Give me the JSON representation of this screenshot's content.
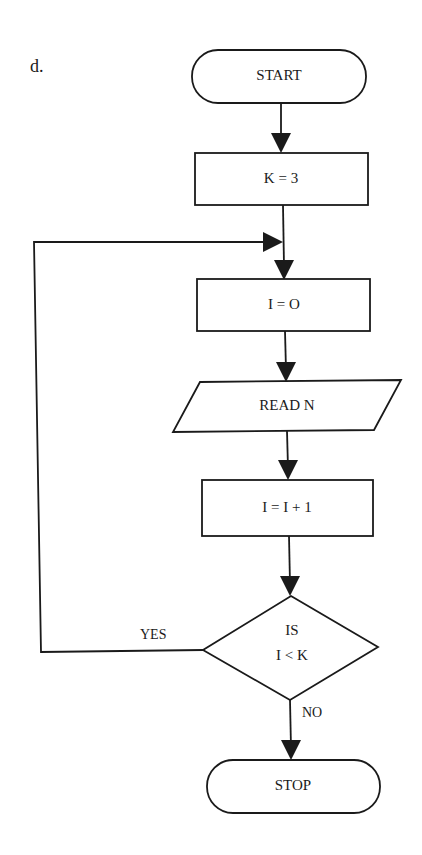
{
  "diagram": {
    "part_label": "d.",
    "nodes": {
      "start": {
        "type": "terminal",
        "label": "START"
      },
      "k_init": {
        "type": "process",
        "label": "K = 3"
      },
      "i_init": {
        "type": "process",
        "label": "I = O"
      },
      "read": {
        "type": "input-output",
        "label": "READ N"
      },
      "increment": {
        "type": "process",
        "label": "I = I + 1"
      },
      "decision": {
        "type": "decision",
        "label_line1": "IS",
        "label_line2": "I < K"
      },
      "stop": {
        "type": "terminal",
        "label": "STOP"
      }
    },
    "edges": {
      "yes_label": "YES",
      "no_label": "NO"
    },
    "flow": [
      {
        "from": "start",
        "to": "k_init"
      },
      {
        "from": "k_init",
        "to": "i_init"
      },
      {
        "from": "i_init",
        "to": "read"
      },
      {
        "from": "read",
        "to": "increment"
      },
      {
        "from": "increment",
        "to": "decision"
      },
      {
        "from": "decision",
        "to": "i_init",
        "condition": "YES"
      },
      {
        "from": "decision",
        "to": "stop",
        "condition": "NO"
      }
    ]
  }
}
